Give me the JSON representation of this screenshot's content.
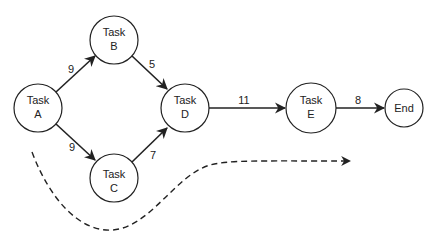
{
  "diagram": {
    "type": "network-diagram",
    "nodes": [
      {
        "id": "A",
        "line1": "Task",
        "line2": "A",
        "cx": 38,
        "cy": 108,
        "r": 24
      },
      {
        "id": "B",
        "line1": "Task",
        "line2": "B",
        "cx": 114,
        "cy": 40,
        "r": 24
      },
      {
        "id": "C",
        "line1": "Task",
        "line2": "C",
        "cx": 114,
        "cy": 178,
        "r": 24
      },
      {
        "id": "D",
        "line1": "Task",
        "line2": "D",
        "cx": 185,
        "cy": 108,
        "r": 24
      },
      {
        "id": "E",
        "line1": "Task",
        "line2": "E",
        "cx": 311,
        "cy": 108,
        "r": 25
      },
      {
        "id": "End",
        "line1": "End",
        "line2": "",
        "cx": 404,
        "cy": 108,
        "r": 19
      }
    ],
    "edges": [
      {
        "from": "A",
        "to": "B",
        "weight": "9"
      },
      {
        "from": "A",
        "to": "C",
        "weight": "9"
      },
      {
        "from": "B",
        "to": "D",
        "weight": "5"
      },
      {
        "from": "C",
        "to": "D",
        "weight": "7"
      },
      {
        "from": "D",
        "to": "E",
        "weight": "11"
      },
      {
        "from": "E",
        "to": "End",
        "weight": "8"
      }
    ],
    "flow_arrow": {
      "style": "dashed",
      "direction": "left-to-right"
    }
  }
}
